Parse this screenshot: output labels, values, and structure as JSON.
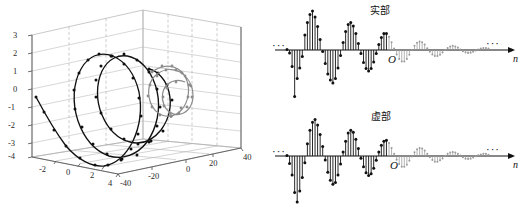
{
  "figure": {
    "panels": [
      {
        "name": "3d-helix-plot",
        "type": "line3d"
      },
      {
        "name": "real-part-stem",
        "title": "实部"
      },
      {
        "name": "imag-part-stem",
        "title": "虚部"
      }
    ]
  },
  "plot3d": {
    "z_ticks": [
      "3",
      "2",
      "1",
      "0",
      "-1",
      "-2",
      "-3",
      "-4"
    ],
    "x_ticks": [
      "-2",
      "0",
      "2",
      "4"
    ],
    "y_ticks": [
      "-40",
      "-20",
      "0",
      "20",
      "40"
    ],
    "marker_color": "#111111",
    "tail_color": "#8c8c8c",
    "grid_color": "#9a9a9a"
  },
  "stem_real": {
    "title": "实部",
    "origin_label": "O",
    "axis_label": "n",
    "left_ellipsis": "···",
    "right_ellipsis": "···",
    "near_color": "#111111",
    "far_color": "#9a9a9a"
  },
  "stem_imag": {
    "title": "虚部",
    "origin_label": "O",
    "axis_label": "n",
    "left_ellipsis": "···",
    "right_ellipsis": "···",
    "near_color": "#111111",
    "far_color": "#9a9a9a"
  },
  "chart_data": [
    {
      "type": "line",
      "name": "3d-helix-plot",
      "title": "",
      "xlabel": "",
      "ylabel": "",
      "zlabel": "",
      "projection": "3d",
      "grid": true,
      "xlim": [
        -3,
        4
      ],
      "ylim": [
        -40,
        40
      ],
      "zlim": [
        -4,
        3
      ],
      "xticks": [
        -2,
        0,
        2,
        4
      ],
      "yticks": [
        -40,
        -20,
        0,
        20,
        40
      ],
      "zticks": [
        -4,
        -3,
        -2,
        -1,
        0,
        1,
        2,
        3
      ],
      "description": "Decaying complex exponential rendered as a 3D spiral: real part vs n vs imaginary part, drawn with markers on a growing-then-decaying helix.",
      "series": [
        {
          "name": "growing-helix-near",
          "color": "#111111",
          "x": [
            -2.6,
            -2.2,
            -1.7,
            -1.2,
            -0.7,
            -0.2,
            0.3,
            0.8,
            1.3,
            1.8,
            2.2,
            2.5,
            2.6,
            2.4,
            2.0,
            1.4,
            0.7,
            0.0,
            -0.6,
            -1.0,
            -1.2,
            -1.0,
            -0.5,
            0.2,
            1.0,
            1.7,
            2.2,
            2.4,
            2.3,
            1.9,
            1.3,
            0.6,
            0.0,
            -0.4,
            -0.6,
            -0.5,
            -0.1,
            0.4,
            0.9,
            1.3,
            1.5,
            1.4,
            1.1,
            0.6,
            0.1,
            -0.3,
            -0.5
          ],
          "z": [
            -3.6,
            -3.3,
            -2.9,
            -2.5,
            -2.1,
            -1.7,
            -1.3,
            -0.9,
            -0.4,
            0.2,
            0.7,
            1.1,
            1.2,
            1.1,
            0.7,
            0.2,
            -0.4,
            -1.0,
            -1.6,
            -2.1,
            -2.6,
            -2.9,
            -3.0,
            -2.8,
            -2.4,
            -1.8,
            -1.1,
            -0.3,
            0.4,
            0.9,
            1.2,
            1.2,
            1.0,
            0.5,
            -0.1,
            -0.7,
            -1.3,
            -1.7,
            -1.9,
            -1.8,
            -1.4,
            -0.9,
            -0.3,
            0.2,
            0.6,
            0.8,
            0.8
          ]
        },
        {
          "name": "decaying-helix-far",
          "color": "#8c8c8c",
          "x": [
            -0.3,
            0.1,
            0.5,
            0.8,
            0.9,
            0.8,
            0.5,
            0.2,
            -0.1,
            -0.3,
            -0.3,
            -0.2,
            0.1,
            0.3,
            0.5,
            0.5,
            0.4,
            0.2,
            0.0,
            -0.1,
            -0.2,
            -0.1,
            0.0,
            0.1,
            0.2
          ],
          "z": [
            1.0,
            0.9,
            0.6,
            0.2,
            -0.3,
            -0.7,
            -1.0,
            -1.1,
            -0.9,
            -0.6,
            -0.2,
            0.2,
            0.5,
            0.7,
            0.7,
            0.5,
            0.2,
            -0.1,
            -0.4,
            -0.5,
            -0.4,
            -0.2,
            0.0,
            0.2,
            0.3
          ]
        }
      ]
    },
    {
      "type": "bar",
      "name": "real-part-stem",
      "title": "实部",
      "xlabel": "n",
      "ylabel": "",
      "grid": false,
      "axis_style": "stem",
      "description": "Stem plot of the real part of a two-sided exponentially modulated sinusoid; samples left of the origin grow in amplitude (black), samples right of the origin decay (gray).",
      "values": [
        0.02,
        -0.1,
        -0.55,
        -1.55,
        -0.95,
        -0.6,
        -0.22,
        0.5,
        0.92,
        1.18,
        1.3,
        1.1,
        0.78,
        0.35,
        -0.05,
        -0.45,
        -0.8,
        -1.0,
        -1.1,
        -0.95,
        -0.6,
        -0.18,
        0.25,
        0.62,
        0.85,
        0.92,
        0.8,
        0.55,
        0.22,
        -0.12,
        -0.42,
        -0.62,
        -0.7,
        -0.62,
        -0.4,
        -0.12,
        0.18,
        0.42,
        0.55,
        0.55,
        0.44,
        0.26,
        0.05,
        -0.15,
        -0.3,
        -0.38,
        -0.38,
        -0.3,
        -0.16,
        0.0,
        0.14,
        0.24,
        0.28,
        0.26,
        0.18,
        0.06,
        -0.06,
        -0.15,
        -0.2,
        -0.2,
        -0.16,
        -0.08,
        0.0,
        0.07,
        0.12,
        0.14,
        0.12,
        0.08,
        0.02,
        -0.04,
        -0.08,
        -0.1,
        -0.09,
        -0.06,
        -0.02,
        0.02,
        0.05,
        0.07,
        0.07,
        0.05
      ],
      "origin_index": 39
    },
    {
      "type": "bar",
      "name": "imag-part-stem",
      "title": "虚部",
      "xlabel": "n",
      "ylabel": "",
      "grid": false,
      "axis_style": "stem",
      "description": "Stem plot of the imaginary part of the same sequence, quarter-cycle shifted relative to the real part.",
      "values": [
        0.02,
        -0.28,
        -0.7,
        -1.35,
        -1.7,
        -1.3,
        -0.8,
        -0.25,
        0.45,
        0.95,
        1.25,
        1.35,
        1.15,
        0.8,
        0.35,
        -0.15,
        -0.6,
        -0.9,
        -1.05,
        -0.98,
        -0.7,
        -0.3,
        0.15,
        0.55,
        0.85,
        0.95,
        0.88,
        0.62,
        0.28,
        -0.08,
        -0.4,
        -0.62,
        -0.72,
        -0.66,
        -0.45,
        -0.16,
        0.15,
        0.4,
        0.55,
        0.58,
        0.48,
        0.3,
        0.08,
        -0.14,
        -0.3,
        -0.4,
        -0.4,
        -0.32,
        -0.18,
        -0.02,
        0.14,
        0.25,
        0.3,
        0.28,
        0.2,
        0.08,
        -0.05,
        -0.15,
        -0.21,
        -0.21,
        -0.16,
        -0.09,
        0.0,
        0.08,
        0.13,
        0.15,
        0.13,
        0.08,
        0.02,
        -0.05,
        -0.1,
        -0.11,
        -0.1,
        -0.06,
        -0.01,
        0.03,
        0.06,
        0.08,
        0.08,
        0.05
      ],
      "origin_index": 39
    }
  ]
}
